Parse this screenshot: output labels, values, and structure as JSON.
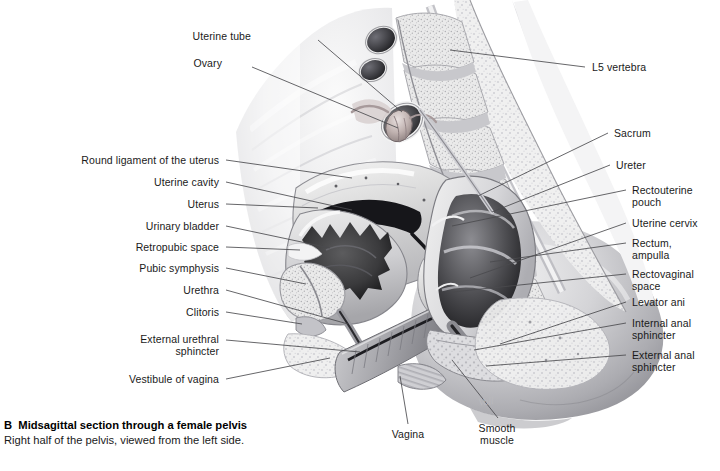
{
  "figure": {
    "letter": "B",
    "title": "Midsagittal section through a female pelvis",
    "subtitle": "Right half of the pelvis, viewed from the left side.",
    "artist_signature": "Voll",
    "background_color": "#ffffff",
    "text_color": "#1a1a1a",
    "leader_line_color": "#4a4a4a",
    "illustration_style": "grayscale anatomical airbrush"
  },
  "labels": {
    "top": [
      {
        "id": "uterine-tube",
        "text": "Uterine tube",
        "x": 251,
        "y": 35
      },
      {
        "id": "ovary",
        "text": "Ovary",
        "x": 222,
        "y": 62
      }
    ],
    "left": [
      {
        "id": "round-ligament-of-the-uterus",
        "text": "Round ligament of the uterus",
        "x": 69,
        "y": 155
      },
      {
        "id": "uterine-cavity",
        "text": "Uterine cavity",
        "x": 137,
        "y": 177
      },
      {
        "id": "uterus",
        "text": "Uterus",
        "x": 169,
        "y": 199
      },
      {
        "id": "urinary-bladder",
        "text": "Urinary bladder",
        "x": 132,
        "y": 221
      },
      {
        "id": "retropubic-space",
        "text": "Retropubic space",
        "x": 124,
        "y": 242
      },
      {
        "id": "pubic-symphysis",
        "text": "Pubic symphysis",
        "x": 132,
        "y": 263
      },
      {
        "id": "urethra",
        "text": "Urethra",
        "x": 169,
        "y": 285
      },
      {
        "id": "clitoris",
        "text": "Clitoris",
        "x": 173,
        "y": 307
      },
      {
        "id": "external-urethral-sphincter",
        "text": "External urethral\nsphincter",
        "x": 136,
        "y": 339
      },
      {
        "id": "vestibule-of-vagina",
        "text": "Vestibule of vagina",
        "x": 124,
        "y": 374
      }
    ],
    "right": [
      {
        "id": "l5-vertebra",
        "text": "L5 vertebra",
        "x": 592,
        "y": 62
      },
      {
        "id": "sacrum",
        "text": "Sacrum",
        "x": 614,
        "y": 128
      },
      {
        "id": "ureter",
        "text": "Ureter",
        "x": 616,
        "y": 160
      },
      {
        "id": "rectouterine-pouch",
        "text": "Rectouterine\npouch",
        "x": 632,
        "y": 185
      },
      {
        "id": "uterine-cervix",
        "text": "Uterine cervix",
        "x": 632,
        "y": 218
      },
      {
        "id": "rectum-ampulla",
        "text": "Rectum,\nampulla",
        "x": 632,
        "y": 238
      },
      {
        "id": "rectovaginal-space",
        "text": "Rectovaginal\nspace",
        "x": 632,
        "y": 269
      },
      {
        "id": "levator-ani",
        "text": "Levator ani",
        "x": 632,
        "y": 297
      },
      {
        "id": "internal-anal-sphincter",
        "text": "Internal anal\nsphincter",
        "x": 632,
        "y": 318
      },
      {
        "id": "external-anal-sphincter",
        "text": "External anal\nsphincter",
        "x": 632,
        "y": 350
      }
    ],
    "bottom": [
      {
        "id": "vagina",
        "text": "Vagina",
        "x": 405,
        "y": 433
      },
      {
        "id": "smooth-muscle",
        "text": "Smooth\nmuscle",
        "x": 490,
        "y": 427
      }
    ]
  }
}
